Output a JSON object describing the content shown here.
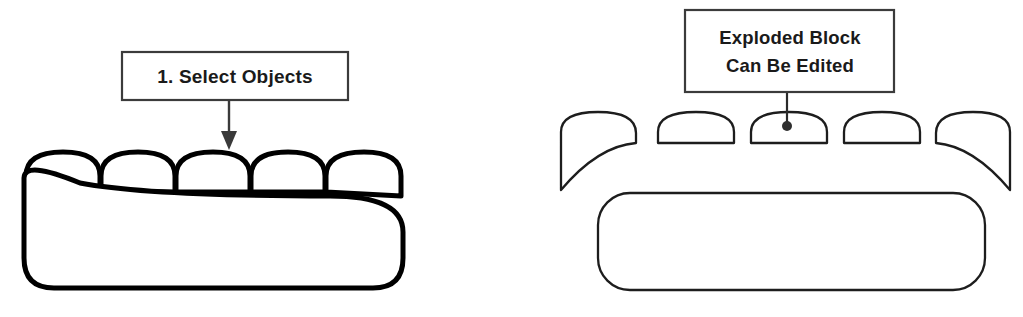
{
  "figure": {
    "background_color": "#ffffff",
    "line_color": "#000000",
    "text_color": "#1a1a1a",
    "box_border_color": "#3b3b3b"
  },
  "left_panel": {
    "callout": {
      "lines": [
        "1. Select Objects"
      ],
      "line1": "1. Select Objects",
      "box": {
        "x": 122,
        "y": 52,
        "width": 226,
        "height": 48
      },
      "arrow": {
        "from_x": 229,
        "from_y": 100,
        "to_x": 229,
        "to_y": 148,
        "head": "solid-triangle-down"
      }
    },
    "drawing": {
      "name": "assembled-block",
      "description": "Sofa-like block: five arched cushions joined on top of one large rounded base",
      "stroke_width": 5,
      "cushion_count": 5,
      "base": {
        "x": 24,
        "y": 186,
        "width": 379,
        "height": 102,
        "corner_radius": 30
      }
    }
  },
  "right_panel": {
    "callout": {
      "lines": [
        "Exploded Block",
        "Can Be Edited"
      ],
      "line1": "Exploded Block",
      "line2": "Can Be Edited",
      "box": {
        "x": 685,
        "y": 10,
        "width": 209,
        "height": 82
      },
      "leader": {
        "from_x": 787,
        "from_y": 92,
        "to_x": 787,
        "to_y": 126,
        "end": "filled-dot",
        "dot_radius": 5
      }
    },
    "drawing": {
      "name": "exploded-block",
      "description": "Same block separated into parts: two end cushions with curved arm tails, three plain cushions, and a detached rounded base",
      "stroke_width": 2.3,
      "cushion_count": 5,
      "base": {
        "x": 598,
        "y": 193,
        "width": 387,
        "height": 97,
        "corner_radius": 32
      }
    }
  }
}
